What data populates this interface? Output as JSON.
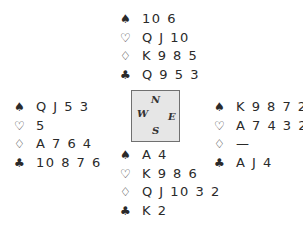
{
  "hands": {
    "north": {
      "spades": "10 6",
      "hearts": "Q J 10",
      "diamonds": "K 9 8 5",
      "clubs": "Q 9 5 3"
    },
    "west": {
      "spades": "Q J 5 3",
      "hearts": "5",
      "diamonds": "A 7 6 4",
      "clubs": "10 8 7 6"
    },
    "east": {
      "spades": "K 9 8 7 2",
      "hearts": "A 7 4 3 2",
      "diamonds": "—",
      "clubs": "A J 4"
    },
    "south": {
      "spades": "A 4",
      "hearts": "K 9 8 6",
      "diamonds": "Q J 10 3 2",
      "clubs": "K 2"
    }
  },
  "suit_symbols": {
    "spades": "♠",
    "hearts": "♡",
    "diamonds": "♢",
    "clubs": "♣"
  },
  "compass": {
    "north": "N",
    "west": "W",
    "east": "E",
    "south": "S"
  },
  "colors": {
    "text": "#2a2a2a",
    "compass_fill": "#e6e6e6",
    "compass_border": "#707070"
  }
}
